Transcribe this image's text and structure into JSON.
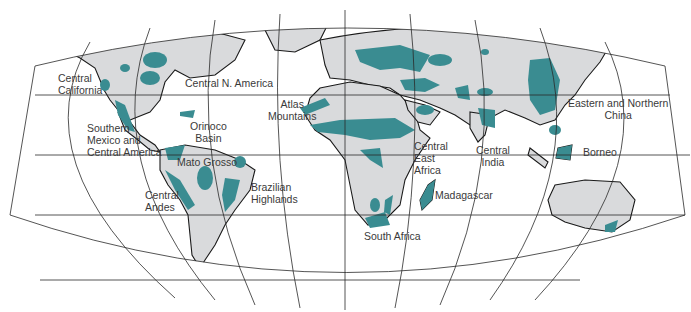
{
  "map": {
    "type": "world-map",
    "projection": "elliptical (Mollweide-like), interrupted graticule",
    "colors": {
      "ocean": "#ffffff",
      "land": "#d9dadc",
      "highlight": "#3a8c91",
      "coastline": "#1a1a1a",
      "graticule": "#2a2a2a"
    },
    "labels": [
      {
        "id": "central-california",
        "lines": [
          "Central",
          "California"
        ]
      },
      {
        "id": "central-n-america",
        "lines": [
          "Central N. America"
        ]
      },
      {
        "id": "southern-mexico",
        "lines": [
          "Southern",
          "Mexico and",
          "Central America"
        ]
      },
      {
        "id": "orinoco-basin",
        "lines": [
          "Orinoco",
          "Basin"
        ]
      },
      {
        "id": "mato-grosso",
        "lines": [
          "Mato Grosso"
        ]
      },
      {
        "id": "central-andes",
        "lines": [
          "Central",
          "Andes"
        ]
      },
      {
        "id": "brazilian-highlands",
        "lines": [
          "Brazilian",
          "Highlands"
        ]
      },
      {
        "id": "atlas-mountains",
        "lines": [
          "Atlas",
          "Mountains"
        ]
      },
      {
        "id": "central-east-africa",
        "lines": [
          "Central",
          "East",
          "Africa"
        ]
      },
      {
        "id": "madagascar",
        "lines": [
          "Madagascar"
        ]
      },
      {
        "id": "south-africa",
        "lines": [
          "South Africa"
        ]
      },
      {
        "id": "central-india",
        "lines": [
          "Central",
          "India"
        ]
      },
      {
        "id": "eastern-northern-china",
        "lines": [
          "Eastern and Northern",
          "China"
        ]
      },
      {
        "id": "borneo",
        "lines": [
          "Borneo"
        ]
      }
    ]
  }
}
